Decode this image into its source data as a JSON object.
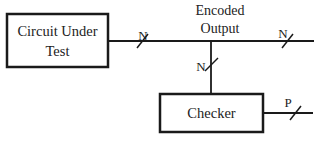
{
  "diagram": {
    "blocks": {
      "cut": {
        "line1": "Circuit Under",
        "line2": "Test"
      },
      "checker": {
        "label": "Checker"
      }
    },
    "signals": {
      "encoded_output": {
        "line1": "Encoded",
        "line2": "Output"
      },
      "cut_out_width": "N",
      "main_out_width": "N",
      "branch_width": "N",
      "checker_out_width": "P"
    },
    "colors": {
      "stroke": "#1a1a1a",
      "text": "#222222",
      "background": "#ffffff"
    }
  }
}
